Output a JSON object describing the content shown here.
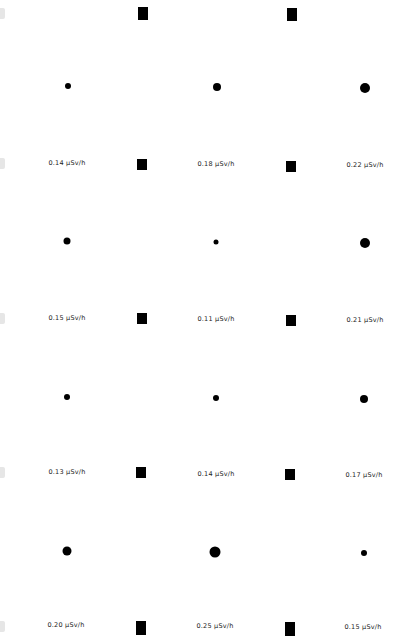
{
  "grid": {
    "unit": "µSv/h",
    "rows": [
      {
        "cells": [
          {
            "value": "0.14",
            "label": "0.14 µSv/h",
            "dot_size": 6
          },
          {
            "value": "0.18",
            "label": "0.18 µSv/h",
            "dot_size": 8
          },
          {
            "value": "0.22",
            "label": "0.22 µSv/h",
            "dot_size": 10
          }
        ]
      },
      {
        "cells": [
          {
            "value": "0.15",
            "label": "0.15 µSv/h",
            "dot_size": 7
          },
          {
            "value": "0.11",
            "label": "0.11 µSv/h",
            "dot_size": 5
          },
          {
            "value": "0.21",
            "label": "0.21 µSv/h",
            "dot_size": 10
          }
        ]
      },
      {
        "cells": [
          {
            "value": "0.13",
            "label": "0.13 µSv/h",
            "dot_size": 6
          },
          {
            "value": "0.14",
            "label": "0.14 µSv/h",
            "dot_size": 6
          },
          {
            "value": "0.17",
            "label": "0.17 µSv/h",
            "dot_size": 8
          }
        ]
      },
      {
        "cells": [
          {
            "value": "0.20",
            "label": "0.20 µSv/h",
            "dot_size": 9
          },
          {
            "value": "0.25",
            "label": "0.25 µSv/h",
            "dot_size": 11
          },
          {
            "value": "0.15",
            "label": "0.15 µSv/h",
            "dot_size": 6
          }
        ]
      }
    ]
  },
  "colors": {
    "dot": "#000000",
    "square": "#000000",
    "edge_marker": "#e6e6e6",
    "background": "#ffffff"
  }
}
